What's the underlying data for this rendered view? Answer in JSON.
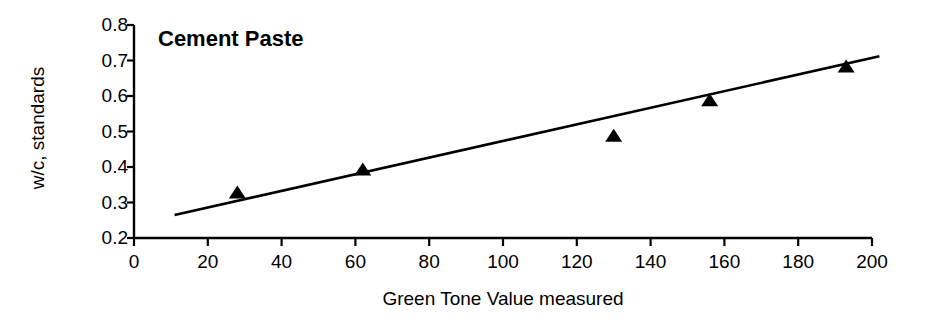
{
  "chart_data": {
    "type": "scatter",
    "title": "Cement Paste",
    "xlabel": "Green Tone Value measured",
    "ylabel": "w/c, standards",
    "xlim": [
      0,
      200
    ],
    "ylim": [
      0.2,
      0.8
    ],
    "xticks": [
      0,
      20,
      40,
      60,
      80,
      100,
      120,
      140,
      160,
      180,
      200
    ],
    "xtick_labels": [
      "0",
      "20",
      "40",
      "60",
      "80",
      "100",
      "120",
      "140",
      "160",
      "180",
      "200"
    ],
    "yticks": [
      0.2,
      0.3,
      0.4,
      0.5,
      0.6,
      0.7,
      0.8
    ],
    "ytick_labels": [
      "0.2",
      "0.3",
      "0.4",
      "0.5",
      "0.6",
      "0.7",
      "0.8"
    ],
    "grid": false,
    "legend": "none",
    "marker": "filled-triangle",
    "marker_color": "#000000",
    "line_color": "#000000",
    "series": [
      {
        "name": "standards",
        "marker": "triangle",
        "points": [
          {
            "x": 28,
            "y": 0.325
          },
          {
            "x": 62,
            "y": 0.39
          },
          {
            "x": 130,
            "y": 0.485
          },
          {
            "x": 156,
            "y": 0.585
          },
          {
            "x": 193,
            "y": 0.68
          }
        ]
      }
    ],
    "trendline": {
      "type": "linear",
      "x_start": 11,
      "y_start": 0.265,
      "x_end": 202,
      "y_end": 0.712
    }
  }
}
